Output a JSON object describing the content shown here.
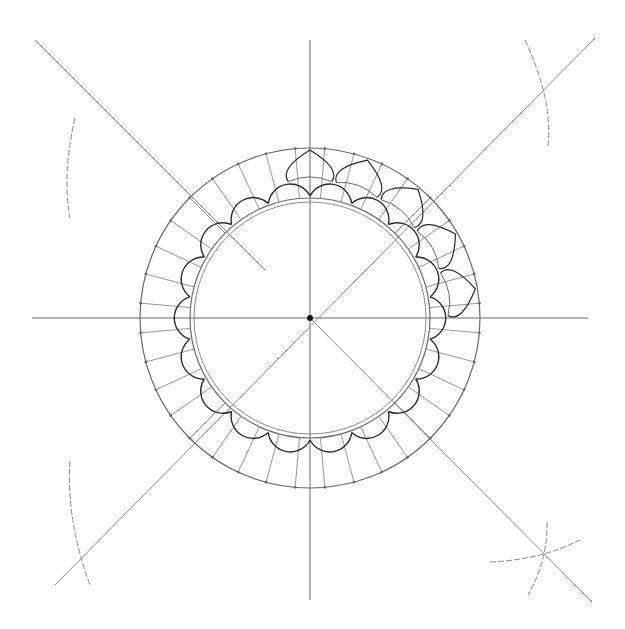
{
  "drawing": {
    "title": "Rosette construction sketch",
    "paper_color": "#ffffff",
    "pencil_light": "#8a8a8a",
    "pencil_mid": "#6a6a6a",
    "pencil_dark": "#2a2a2a",
    "center": [
      310,
      318
    ],
    "outer_circle_radius": 170,
    "inner_circle_radius": 120,
    "inner_circle2_radius": 116,
    "petal_count": 18,
    "radial_division_deg": 10,
    "axes": {
      "horizontal": [
        32,
        318,
        588,
        318
      ],
      "vertical": [
        310,
        40,
        310,
        600
      ]
    },
    "diagonals": [
      [
        35,
        40,
        265,
        270
      ],
      [
        595,
        38,
        55,
        585
      ],
      [
        310,
        318,
        592,
        602
      ]
    ],
    "construction_arcs": [
      {
        "name": "arc-top-left",
        "d": "M 75 118 Q 62 175 70 218"
      },
      {
        "name": "arc-top-right",
        "d": "M 525 40 Q 553 100 548 146"
      },
      {
        "name": "arc-bottom-left",
        "d": "M 70 461 Q 66 520 90 585"
      },
      {
        "name": "arc-bottom-right-1",
        "d": "M 490 562 Q 540 560 580 540"
      },
      {
        "name": "arc-bottom-right-2",
        "d": "M 547 522 Q 548 560 528 595"
      }
    ],
    "center_dot_radius": 3
  }
}
